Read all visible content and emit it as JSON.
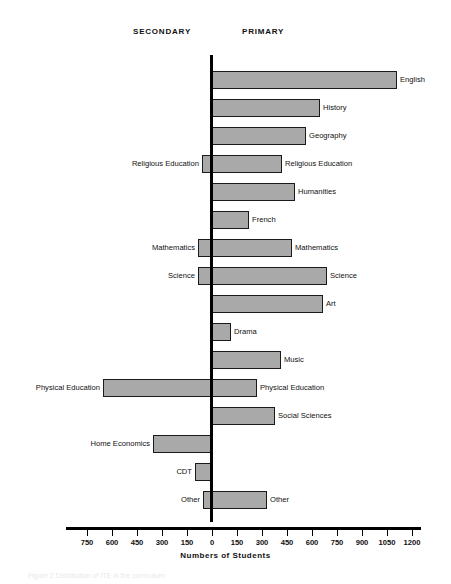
{
  "headers": {
    "secondary": "SECONDARY",
    "primary": "PRIMARY"
  },
  "axis": {
    "xlabel": "Numbers of Students",
    "tick_labels": [
      "750",
      "600",
      "450",
      "300",
      "150",
      "0",
      "150",
      "300",
      "450",
      "600",
      "750",
      "900",
      "1050",
      "1200"
    ],
    "tick_values": [
      -750,
      -600,
      -450,
      -300,
      -150,
      0,
      150,
      300,
      450,
      600,
      750,
      900,
      1050,
      1200
    ]
  },
  "caption": "Figure 2  Distribution of ITE in the curriculum",
  "colors": {
    "bar_fill": "#a9a9a9",
    "bar_border": "#1a1a1a",
    "axis": "#000000",
    "text": "#111111"
  },
  "chart_data": {
    "type": "bar",
    "title": "",
    "subtitle": "",
    "xlabel": "Numbers of Students",
    "ylabel": "",
    "orientation": "horizontal",
    "layout": "diverging-bidirectional",
    "grid": false,
    "legend_position": "top",
    "xlim": [
      -750,
      1200
    ],
    "xtick_step": 150,
    "categories": [
      "English",
      "History",
      "Geography",
      "Religious Education",
      "Humanities",
      "French",
      "Mathematics",
      "Science",
      "Art",
      "Drama",
      "Music",
      "Physical Education",
      "Social Sciences",
      "Home Economics",
      "CDT",
      "Other"
    ],
    "series": [
      {
        "name": "PRIMARY",
        "direction": "right",
        "values": [
          1110,
          648,
          564,
          420,
          498,
          222,
          480,
          690,
          666,
          114,
          414,
          270,
          378,
          0,
          0,
          330
        ]
      },
      {
        "name": "SECONDARY",
        "direction": "left",
        "values": [
          0,
          0,
          0,
          60,
          0,
          0,
          84,
          84,
          0,
          0,
          0,
          654,
          0,
          354,
          102,
          54
        ]
      }
    ],
    "rows": [
      {
        "category": "English",
        "primary": 1110,
        "secondary": 0,
        "label_right": "English",
        "label_left": ""
      },
      {
        "category": "History",
        "primary": 648,
        "secondary": 0,
        "label_right": "History",
        "label_left": ""
      },
      {
        "category": "Geography",
        "primary": 564,
        "secondary": 0,
        "label_right": "Geography",
        "label_left": ""
      },
      {
        "category": "Religious Education",
        "primary": 420,
        "secondary": 60,
        "label_right": "Religious Education",
        "label_left": "Religious Education"
      },
      {
        "category": "Humanities",
        "primary": 498,
        "secondary": 0,
        "label_right": "Humanities",
        "label_left": ""
      },
      {
        "category": "French",
        "primary": 222,
        "secondary": 0,
        "label_right": "French",
        "label_left": ""
      },
      {
        "category": "Mathematics",
        "primary": 480,
        "secondary": 84,
        "label_right": "Mathematics",
        "label_left": "Mathematics"
      },
      {
        "category": "Science",
        "primary": 690,
        "secondary": 84,
        "label_right": "Science",
        "label_left": "Science"
      },
      {
        "category": "Art",
        "primary": 666,
        "secondary": 0,
        "label_right": "Art",
        "label_left": ""
      },
      {
        "category": "Drama",
        "primary": 114,
        "secondary": 0,
        "label_right": "Drama",
        "label_left": ""
      },
      {
        "category": "Music",
        "primary": 414,
        "secondary": 0,
        "label_right": "Music",
        "label_left": ""
      },
      {
        "category": "Physical Education",
        "primary": 270,
        "secondary": 654,
        "label_right": "Physical Education",
        "label_left": "Physical Education"
      },
      {
        "category": "Social Sciences",
        "primary": 378,
        "secondary": 0,
        "label_right": "Social Sciences",
        "label_left": ""
      },
      {
        "category": "Home Economics",
        "primary": 0,
        "secondary": 354,
        "label_right": "",
        "label_left": "Home Economics"
      },
      {
        "category": "CDT",
        "primary": 0,
        "secondary": 102,
        "label_right": "",
        "label_left": "CDT"
      },
      {
        "category": "Other",
        "primary": 330,
        "secondary": 54,
        "label_right": "Other",
        "label_left": "Other"
      }
    ]
  }
}
